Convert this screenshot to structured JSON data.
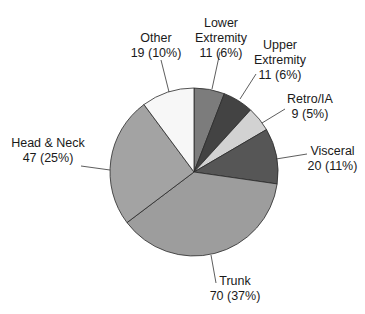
{
  "chart_data": {
    "type": "pie",
    "title": "",
    "start_angle_deg": 0,
    "direction": "clockwise",
    "total": 187,
    "slices": [
      {
        "name": "Lower Extremity",
        "label_line1": "Lower",
        "label_line2": "Extremity",
        "label_value": "11 (6%)",
        "value": 11,
        "percent": 6,
        "color": "#7c7c7c"
      },
      {
        "name": "Upper Extremity",
        "label_line1": "Upper",
        "label_line2": "Extremity",
        "label_value": "11 (6%)",
        "value": 11,
        "percent": 6,
        "color": "#434343"
      },
      {
        "name": "Retro/IA",
        "label_line1": "Retro/IA",
        "label_line2": "",
        "label_value": "9 (5%)",
        "value": 9,
        "percent": 5,
        "color": "#d2d2d2"
      },
      {
        "name": "Visceral",
        "label_line1": "Visceral",
        "label_line2": "",
        "label_value": "20 (11%)",
        "value": 20,
        "percent": 11,
        "color": "#565656"
      },
      {
        "name": "Trunk",
        "label_line1": "Trunk",
        "label_line2": "",
        "label_value": "70 (37%)",
        "value": 70,
        "percent": 37,
        "color": "#9d9d9d"
      },
      {
        "name": "Head & Neck",
        "label_line1": "Head & Neck",
        "label_line2": "",
        "label_value": "47 (25%)",
        "value": 47,
        "percent": 25,
        "color": "#a3a3a3"
      },
      {
        "name": "Other",
        "label_line1": "Other",
        "label_line2": "",
        "label_value": "19 (10%)",
        "value": 19,
        "percent": 10,
        "color": "#f7f7f7"
      }
    ],
    "legend": "none (direct labels with leader lines)"
  }
}
